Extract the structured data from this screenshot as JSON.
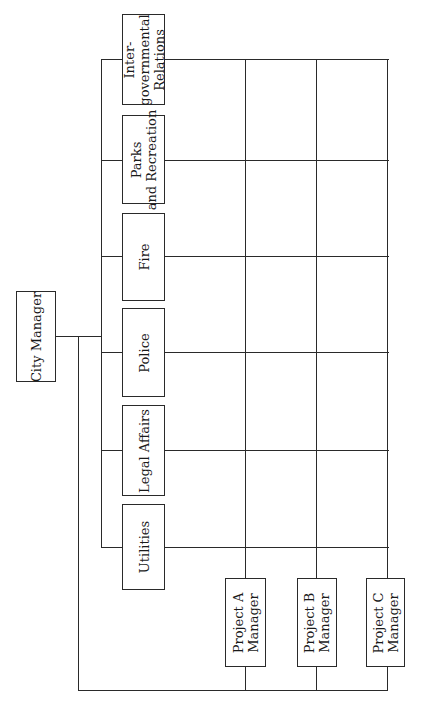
{
  "diagram": {
    "type": "matrix-organization-chart",
    "orientation": "rotated-90-ccw",
    "top": {
      "label": "City Manager"
    },
    "departments": [
      {
        "id": "intergovernmental-relations",
        "lines": [
          "Inter-",
          "governmental",
          "Relations"
        ]
      },
      {
        "id": "parks-and-recreation",
        "lines": [
          "Parks",
          "and Recreation"
        ]
      },
      {
        "id": "fire",
        "lines": [
          "Fire"
        ]
      },
      {
        "id": "police",
        "lines": [
          "Police"
        ]
      },
      {
        "id": "legal-affairs",
        "lines": [
          "Legal Affairs"
        ]
      },
      {
        "id": "utilities",
        "lines": [
          "Utilities"
        ]
      }
    ],
    "project_managers": [
      {
        "id": "project-a-manager",
        "lines": [
          "Project A",
          "Manager"
        ]
      },
      {
        "id": "project-b-manager",
        "lines": [
          "Project B",
          "Manager"
        ]
      },
      {
        "id": "project-c-manager",
        "lines": [
          "Project C",
          "Manager"
        ]
      }
    ],
    "colors": {
      "line": "#2a2a2a",
      "background": "#ffffff",
      "text": "#1a1a1a"
    }
  }
}
